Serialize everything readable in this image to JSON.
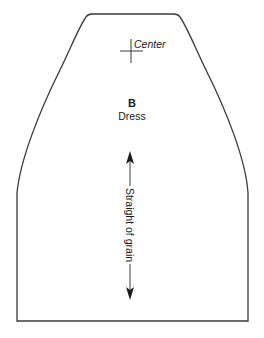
{
  "pattern_piece": {
    "letter": "B",
    "name": "Dress",
    "center_mark_label": "Center",
    "grainline_label": "Straight of grain"
  },
  "colors": {
    "outline": "#3a3a3a",
    "text": "#1a1a1a",
    "background": "#ffffff"
  },
  "icons": {
    "center_mark": "crosshair-icon",
    "grainline": "double-arrow-icon"
  }
}
